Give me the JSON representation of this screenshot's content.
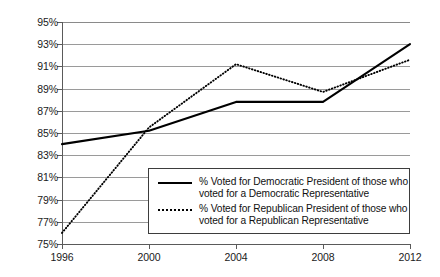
{
  "chart_data": {
    "type": "line",
    "title": "",
    "xlabel": "",
    "ylabel": "",
    "x": [
      1996,
      2000,
      2004,
      2008,
      2012
    ],
    "categories": [
      "1996",
      "2000",
      "2004",
      "2008",
      "2012"
    ],
    "xtick_labels": [
      "1996",
      "2000",
      "2004",
      "2008",
      "2012"
    ],
    "ytick_labels": [
      "95%",
      "93%",
      "91%",
      "89%",
      "87%",
      "85%",
      "83%",
      "81%",
      "79%",
      "77%",
      "75%"
    ],
    "ytick_values": [
      95,
      93,
      91,
      89,
      87,
      85,
      83,
      81,
      79,
      77,
      75
    ],
    "ylim": [
      75,
      95
    ],
    "xlim": [
      1996,
      2012
    ],
    "grid": true,
    "grid_axis": "y",
    "legend_position": "inside-bottom-center",
    "series": [
      {
        "name": "% Voted for Democratic President of those who voted for a Democratic Representative",
        "label_line1": "% Voted for Democratic President of those who",
        "label_line2": "voted for a Democratic Representative",
        "style": "solid",
        "color": "#000000",
        "values": [
          84.0,
          85.2,
          87.8,
          87.8,
          93.0
        ]
      },
      {
        "name": "% Voted for Republican President of those who voted for a Republican Representative",
        "label_line1": "% Voted for Republican President of those who",
        "label_line2": "voted for a Republican Representative",
        "style": "dotted",
        "color": "#000000",
        "values": [
          76.0,
          85.5,
          91.2,
          88.7,
          91.6
        ]
      }
    ]
  },
  "colors": {
    "gridline": "#9a9a9a",
    "axis": "#5a5a5a",
    "text": "#1a1a1a",
    "legend_border": "#3d3d3d",
    "background": "#ffffff"
  }
}
